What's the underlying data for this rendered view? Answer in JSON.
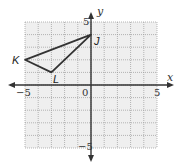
{
  "diagram": {
    "type": "coordinate-plane",
    "axes": {
      "x_label": "x",
      "y_label": "y",
      "x_range": [
        -5,
        5
      ],
      "y_range": [
        -5,
        5
      ],
      "ticks": {
        "x_neg": "−5",
        "x_pos": "5",
        "origin": "0",
        "y_pos": "5",
        "y_neg": "−5"
      }
    },
    "grid": {
      "step": 1,
      "color": "#9a9a9a",
      "background": "#efefef"
    },
    "triangle": {
      "stroke": "#333333",
      "vertices": [
        {
          "name": "J",
          "x": 0,
          "y": 4
        },
        {
          "name": "K",
          "x": -5,
          "y": 2
        },
        {
          "name": "L",
          "x": -3,
          "y": 1
        }
      ]
    }
  }
}
